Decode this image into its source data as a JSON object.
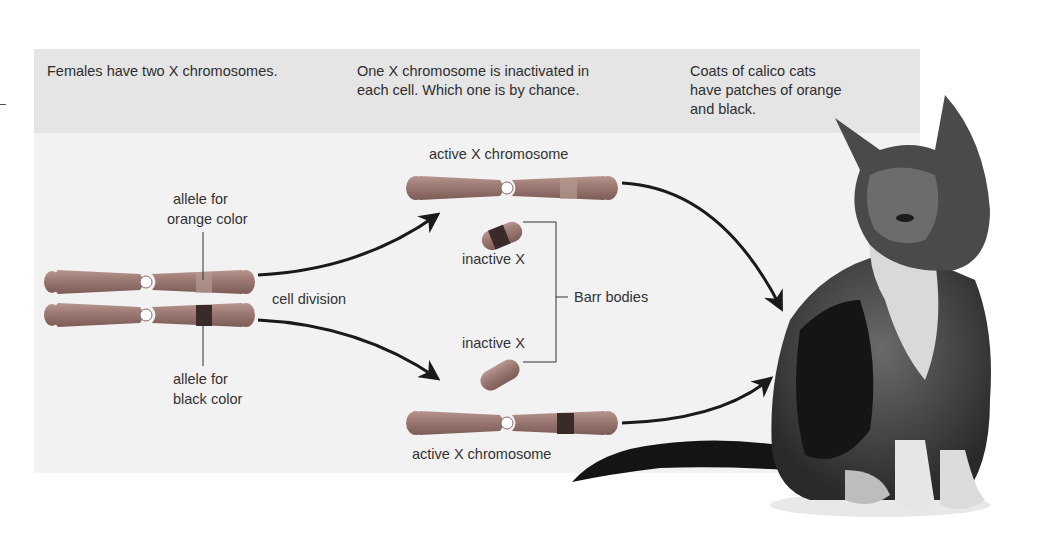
{
  "figure": {
    "header": {
      "col1": "Females have two X chromosomes.",
      "col2_line1": "One X chromosome is inactivated in",
      "col2_line2": "each cell. Which one is by chance.",
      "col3_line1": "Coats of calico cats",
      "col3_line2": "have patches of orange",
      "col3_line3": "and black."
    },
    "labels": {
      "allele_orange_1": "allele for",
      "allele_orange_2": "orange color",
      "allele_black_1": "allele for",
      "allele_black_2": "black color",
      "cell_division": "cell division",
      "active_top": "active X chromosome",
      "inactive_top": "inactive X",
      "inactive_bottom": "inactive X",
      "active_bottom": "active X chromosome",
      "barr_bodies": "Barr bodies"
    },
    "colors": {
      "chromosome": "#9a7670",
      "orange_band": "#b08f84",
      "black_band": "#3a2a28",
      "header_bg": "#e5e5e5",
      "panel_bg": "#f2f2f2",
      "arrow": "#1a1a1a"
    },
    "icons": [
      "chromosome-pair",
      "arrow-icon",
      "barr-body",
      "calico-cat-photo"
    ]
  }
}
